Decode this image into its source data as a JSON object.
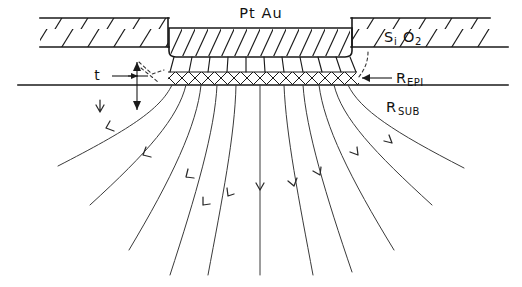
{
  "figure": {
    "type": "technical-cross-section-diagram",
    "width": 522,
    "height": 287,
    "background_color": "#ffffff",
    "ink_color": "#1a1a1a"
  },
  "labels": {
    "metal_contact": "Pt  Au",
    "oxide": {
      "base": "S",
      "sub1": "i",
      "base2": "O",
      "sub2": "2",
      "full": "Si O2"
    },
    "epi_resistance": {
      "base": "R",
      "sub": "EPI",
      "full": "REPI"
    },
    "substrate_resistance": {
      "base": "R",
      "sub": "SUB",
      "full": "RSUB"
    },
    "thickness": "t"
  },
  "layers": [
    {
      "name": "oxide-left",
      "label": "Si O2",
      "fill_pattern": "diagonal-hatch",
      "x": 40,
      "y": 18,
      "width": 128,
      "height": 29
    },
    {
      "name": "metal-contact",
      "label": "Pt Au",
      "fill_pattern": "dense-diagonal-hatch",
      "x": 168,
      "y": 28,
      "width": 184,
      "height": 29
    },
    {
      "name": "oxide-right",
      "label": "Si O2",
      "fill_pattern": "diagonal-hatch",
      "x": 352,
      "y": 18,
      "width": 138,
      "height": 29
    },
    {
      "name": "epi-layer",
      "label": "REPI",
      "fill_pattern": "cross-hatch",
      "x": 166,
      "y": 72,
      "width": 192,
      "height": 13
    },
    {
      "name": "substrate",
      "label": "RSUB",
      "fill_pattern": "none",
      "y_top": 85
    }
  ],
  "geometry": {
    "oxide_top_y": 18,
    "oxide_bottom_y": 47,
    "contact_top_y": 28,
    "contact_bottom_y": 57,
    "epi_top_y": 72,
    "substrate_line_y": 85,
    "substrate_line_x_start": 18,
    "substrate_line_x_end": 508,
    "contact_x_left": 168,
    "contact_x_right": 352,
    "oxide_left_x_start": 40,
    "oxide_right_x_end": 490,
    "flow_lines_count": 11,
    "flow_lines_bottom_y": 275
  },
  "annotations": {
    "thickness_dimension": {
      "label": "t",
      "label_x": 97,
      "label_y": 79,
      "arrow_x": 137,
      "arrow_top_y": 62,
      "arrow_bottom_y": 110
    },
    "epi_pointer_arrow": {
      "direction": "left",
      "x_tip": 362,
      "x_tail": 392,
      "y": 78
    },
    "oxide_label_pos": {
      "x": 384,
      "y": 42
    },
    "metal_label_pos": {
      "x": 228,
      "y": 18
    },
    "epi_label_pos": {
      "x": 398,
      "y": 82
    },
    "sub_label_pos": {
      "x": 386,
      "y": 110
    }
  },
  "flow_lines": {
    "description": "Current spreading streamlines fanning outward from the contact into the substrate",
    "arrowheads_per_line": 1,
    "stroke_color": "#3a3a3a",
    "paths": [
      {
        "id": 1,
        "start_x": 172,
        "end_x": 58,
        "curve": "strong-left"
      },
      {
        "id": 2,
        "start_x": 186,
        "end_x": 90,
        "curve": "left"
      },
      {
        "id": 3,
        "start_x": 201,
        "end_x": 129,
        "curve": "left"
      },
      {
        "id": 4,
        "start_x": 217,
        "end_x": 170,
        "curve": "slight-left"
      },
      {
        "id": 5,
        "start_x": 236,
        "end_x": 208,
        "curve": "slight-left"
      },
      {
        "id": 6,
        "start_x": 260,
        "end_x": 260,
        "curve": "straight"
      },
      {
        "id": 7,
        "start_x": 284,
        "end_x": 310,
        "curve": "slight-right"
      },
      {
        "id": 8,
        "start_x": 303,
        "end_x": 350,
        "curve": "slight-right"
      },
      {
        "id": 9,
        "start_x": 319,
        "end_x": 392,
        "curve": "right"
      },
      {
        "id": 10,
        "start_x": 334,
        "end_x": 430,
        "curve": "right"
      },
      {
        "id": 11,
        "start_x": 348,
        "end_x": 462,
        "curve": "strong-right"
      }
    ]
  }
}
